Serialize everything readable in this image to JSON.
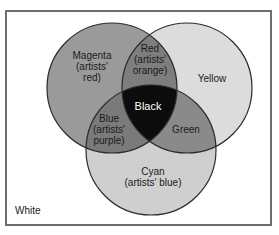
{
  "diagram": {
    "type": "venn",
    "background_label": "White",
    "colors": {
      "frame": "#6e6e6e",
      "outline": "#2a2a2a",
      "magenta": "#9a9a9a",
      "yellow": "#dcdcdc",
      "cyan": "#cfcfcf",
      "red_overlap": "#7e7e7e",
      "blue_overlap": "#7a7a7a",
      "green_overlap": "#8a8a8a",
      "black_center": "#0c0c0c"
    },
    "circles": [
      {
        "name": "Magenta",
        "lines": [
          "Magenta",
          "(artists'",
          "red)"
        ]
      },
      {
        "name": "Yellow",
        "lines": [
          "Yellow"
        ]
      },
      {
        "name": "Cyan",
        "lines": [
          "Cyan",
          "(artists' blue)"
        ]
      }
    ],
    "overlaps": {
      "red": {
        "lines": [
          "Red",
          "(artists'",
          "orange)"
        ]
      },
      "blue": {
        "lines": [
          "Blue",
          "(artists'",
          "purple)"
        ]
      },
      "green": {
        "lines": [
          "Green"
        ]
      },
      "black": {
        "lines": [
          "Black"
        ]
      }
    }
  }
}
